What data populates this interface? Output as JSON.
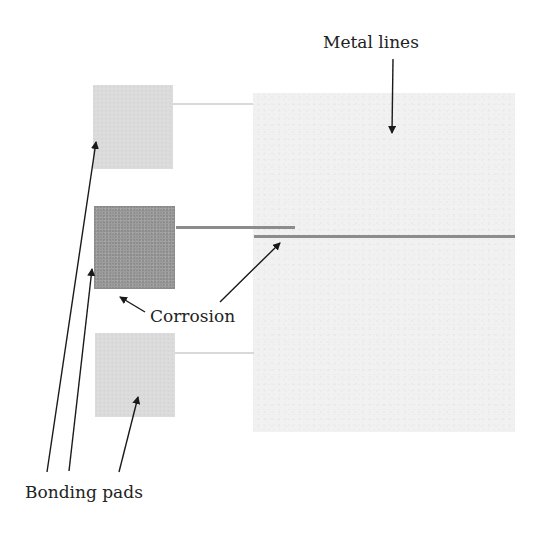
{
  "diagram": {
    "labels": {
      "metal_lines": "Metal lines",
      "corrosion": "Corrosion",
      "bonding_pads": "Bonding pads"
    },
    "pads": [
      {
        "id": "top",
        "state": "normal",
        "color": "#dcdcdc"
      },
      {
        "id": "middle",
        "state": "corroded",
        "color": "#9c9c9c"
      },
      {
        "id": "bottom",
        "state": "normal",
        "color": "#dcdcdc"
      }
    ],
    "metal_lines": [
      {
        "id": "top-line",
        "state": "normal",
        "color": "#d9d9d9"
      },
      {
        "id": "middle-line-pad-segment",
        "state": "corroded",
        "color": "#8c8c8c"
      },
      {
        "id": "middle-line-long",
        "state": "corroded",
        "color": "#8c8c8c"
      },
      {
        "id": "bottom-line",
        "state": "normal",
        "color": "#d9d9d9"
      }
    ],
    "metal_area_color": "#f1f1f1",
    "arrow_color": "#1a1a1a"
  }
}
